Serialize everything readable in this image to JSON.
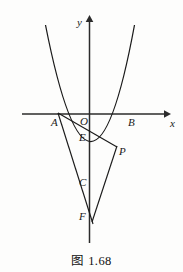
{
  "figure": {
    "caption": "图 1.68",
    "axes": {
      "x_label": "x",
      "y_label": "y"
    },
    "points": [
      {
        "id": "A",
        "label": "A",
        "x": 58,
        "y": 113,
        "label_x": 51,
        "label_y": 117
      },
      {
        "id": "O",
        "label": "O",
        "x": 91,
        "y": 114,
        "label_x": 80,
        "label_y": 117
      },
      {
        "id": "B",
        "label": "B",
        "x": 127,
        "y": 114,
        "label_x": 128,
        "label_y": 117
      },
      {
        "id": "E",
        "label": "E",
        "x": 91,
        "y": 134,
        "label_x": 79,
        "label_y": 134
      },
      {
        "id": "P",
        "label": "P",
        "x": 116,
        "y": 146,
        "label_x": 119,
        "label_y": 147
      },
      {
        "id": "C",
        "label": "C",
        "x": 91,
        "y": 176,
        "label_x": 80,
        "label_y": 178
      },
      {
        "id": "F",
        "label": "F",
        "x": 92,
        "y": 220,
        "label_x": 80,
        "label_y": 212
      }
    ],
    "segments": [
      {
        "id": "AP",
        "from": "A",
        "to": "P"
      },
      {
        "id": "FP",
        "from": "F",
        "to": "P"
      }
    ],
    "curve": {
      "id": "parabola",
      "roots": [
        "A",
        "B"
      ],
      "vertex": "C"
    },
    "colors": {
      "stroke": "#1a1a1a",
      "axis": "#3a3a3a",
      "background": "#fdfdfc"
    }
  }
}
